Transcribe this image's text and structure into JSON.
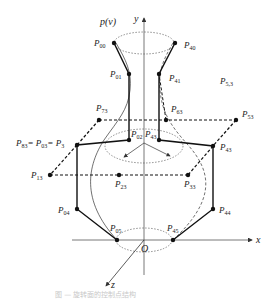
{
  "figure": {
    "curve_label": "p(v)",
    "caption": "图 — 旋转面的控制点结构",
    "axes": {
      "x": "x",
      "y": "y",
      "z": "z",
      "origin": "O"
    },
    "points": {
      "P00": {
        "main": "P",
        "sub": "00"
      },
      "P40": {
        "main": "P",
        "sub": "40"
      },
      "P01": {
        "main": "P",
        "sub": "01"
      },
      "P41": {
        "main": "P",
        "sub": "41"
      },
      "P53b": {
        "main": "P",
        "sub": "5,3"
      },
      "P73": {
        "main": "P",
        "sub": "73"
      },
      "P63": {
        "main": "P",
        "sub": "63"
      },
      "P53": {
        "main": "P",
        "sub": "53"
      },
      "P83eq": {
        "main": "P",
        "sub": "83",
        "eq1": "= P",
        "sub2": "03",
        "eq2": "= P",
        "sub3": "3"
      },
      "P02": {
        "main": "P",
        "sub": "02"
      },
      "P43": {
        "main": "P",
        "sub": "43"
      },
      "P43r": {
        "main": "P",
        "sub": "43"
      },
      "P13": {
        "main": "P",
        "sub": "13"
      },
      "P23": {
        "main": "P",
        "sub": "23"
      },
      "P33": {
        "main": "P",
        "sub": "33"
      },
      "P04": {
        "main": "P",
        "sub": "04"
      },
      "P44": {
        "main": "P",
        "sub": "44"
      },
      "P05": {
        "main": "P",
        "sub": "05"
      },
      "P45": {
        "main": "P",
        "sub": "45"
      }
    },
    "colors": {
      "ink": "#222222",
      "axis": "#555555",
      "dotted": "#444444"
    }
  }
}
